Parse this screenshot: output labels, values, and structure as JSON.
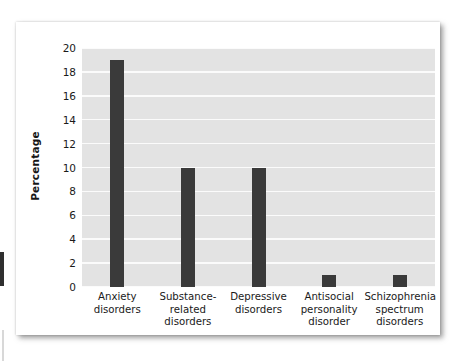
{
  "figure": {
    "background_color": "#ffffff",
    "plot_background_color": "#e3e3e3",
    "bar_color": "#3a3a3a",
    "gridline_color": "#fbfbfb"
  },
  "chart_data": {
    "type": "bar",
    "title": "",
    "xlabel": "",
    "ylabel": "Percentage",
    "ylim": [
      0,
      20
    ],
    "yticks": [
      0,
      2,
      4,
      6,
      8,
      10,
      12,
      14,
      16,
      18,
      20
    ],
    "ytick_labels": [
      "0",
      "2",
      "4",
      "6",
      "8",
      "10",
      "12",
      "14",
      "16",
      "18",
      "20"
    ],
    "grid": "horizontal",
    "legend": "none",
    "categories": [
      "Anxiety\ndisorders",
      "Substance-\nrelated\ndisorders",
      "Depressive\ndisorders",
      "Antisocial\npersonality\ndisorder",
      "Schizophrenia\nspectrum\ndisorders"
    ],
    "values": [
      19,
      10,
      10,
      1,
      1
    ]
  }
}
